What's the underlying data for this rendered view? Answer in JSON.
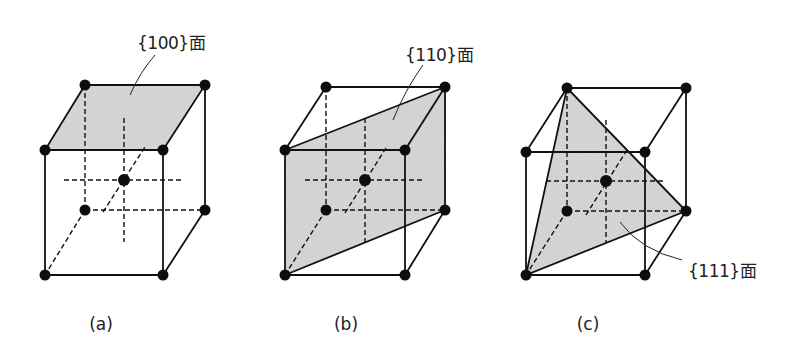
{
  "figure": {
    "panels": [
      {
        "id": "a",
        "caption": "(a)",
        "plane_label": "{100}面",
        "plane": "top face of cube (100 plane)"
      },
      {
        "id": "b",
        "caption": "(b)",
        "plane_label": "{110}面",
        "plane": "diagonal plane through cube (110 plane)"
      },
      {
        "id": "c",
        "caption": "(c)",
        "plane_label": "{111}面",
        "plane": "triangular cross-section (111 plane)"
      }
    ],
    "colors": {
      "line": "#111111",
      "atom": "#0d0d0d",
      "plane_fill": "#d9d9d9"
    },
    "structure": "body-centered cubic unit cell"
  }
}
